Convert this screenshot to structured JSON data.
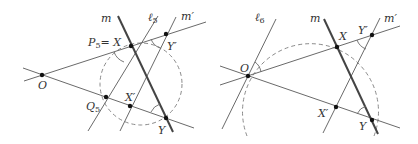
{
  "figure": {
    "colors": {
      "line": "#6a6a6a",
      "thick_line": "#444444",
      "dashed": "#8a8a8a",
      "point": "#111111"
    }
  },
  "left": {
    "labels": {
      "m": "m",
      "l5": "ℓ",
      "l5_sub": "5",
      "mprime": "m′",
      "P5": "P",
      "P5_sub": "5",
      "P5_eq": "= X",
      "Yprime": "Y′",
      "O": "O",
      "Q5": "Q",
      "Q5_sub": "5",
      "Xprime": "X′",
      "Y": "Y"
    },
    "points": {
      "O": [
        42,
        75
      ],
      "X": [
        131,
        46
      ],
      "Yprime": [
        166,
        34
      ],
      "Q5": [
        106,
        97
      ],
      "Xprime": [
        130,
        106
      ],
      "Y": [
        166,
        118
      ]
    }
  },
  "right": {
    "labels": {
      "l6": "ℓ",
      "l6_sub": "6",
      "m": "m",
      "mprime": "m′",
      "X": "X",
      "Yprime": "Y′",
      "O": "O",
      "Xprime": "X′",
      "Y": "Y"
    },
    "points": {
      "O": [
        248,
        76
      ],
      "X": [
        337,
        47
      ],
      "Yprime": [
        372,
        35
      ],
      "Xprime": [
        336,
        107
      ],
      "Y": [
        372,
        120
      ]
    }
  }
}
